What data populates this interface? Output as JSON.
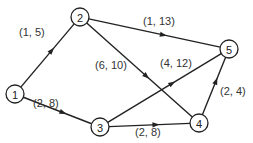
{
  "diagram": {
    "type": "directed-network",
    "nodes": [
      {
        "id": "1",
        "label": "1",
        "x": 15,
        "y": 94
      },
      {
        "id": "2",
        "label": "2",
        "x": 80,
        "y": 17
      },
      {
        "id": "3",
        "label": "3",
        "x": 100,
        "y": 127
      },
      {
        "id": "4",
        "label": "4",
        "x": 199,
        "y": 123
      },
      {
        "id": "5",
        "label": "5",
        "x": 229,
        "y": 49
      }
    ],
    "edges": [
      {
        "from": "1",
        "to": "2",
        "label": "(1, 5)",
        "lx": 19,
        "ly": 36
      },
      {
        "from": "1",
        "to": "3",
        "label": "(2, 8)",
        "lx": 33,
        "ly": 107
      },
      {
        "from": "2",
        "to": "5",
        "label": "(1, 13)",
        "lx": 143,
        "ly": 25
      },
      {
        "from": "2",
        "to": "4",
        "label": "(6, 10)",
        "lx": 95,
        "ly": 69
      },
      {
        "from": "3",
        "to": "5",
        "label": "(4, 12)",
        "lx": 160,
        "ly": 67
      },
      {
        "from": "3",
        "to": "4",
        "label": "(2, 8)",
        "lx": 135,
        "ly": 136
      },
      {
        "from": "4",
        "to": "5",
        "label": "(2, 4)",
        "lx": 220,
        "ly": 95
      }
    ]
  }
}
